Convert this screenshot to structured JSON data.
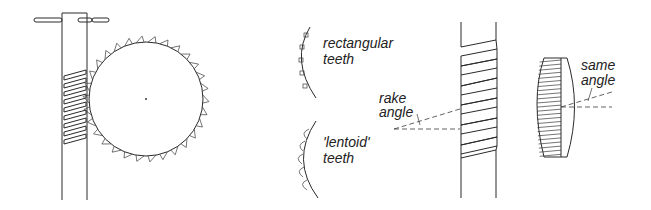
{
  "diagram": {
    "type": "technical-illustration",
    "labels": {
      "rectangular": [
        "rectangular",
        "teeth"
      ],
      "lentoid": [
        "'lentoid'",
        "teeth"
      ],
      "rake": [
        "rake",
        "angle"
      ],
      "same": [
        "same",
        "angle"
      ]
    },
    "colors": {
      "line": "#2a2a2a",
      "background": "#ffffff"
    },
    "panels": [
      {
        "name": "worm-and-wheel",
        "description": "worm shaft meshing with toothed wheel"
      },
      {
        "name": "tooth-profiles",
        "description": "rectangular vs lentoid teeth on arc"
      },
      {
        "name": "worm-rake-angle",
        "description": "worm thread with rake angle"
      },
      {
        "name": "pinion-same-angle",
        "description": "pinion showing same angle"
      }
    ]
  }
}
